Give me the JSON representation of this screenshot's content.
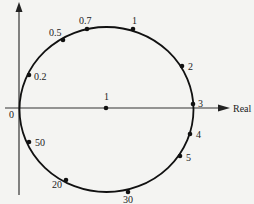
{
  "diagram": {
    "type": "nyquist-plot",
    "axis": {
      "real_label": "Real",
      "origin_label": "0"
    },
    "center_point": {
      "label": "1",
      "x": 106,
      "y": 108,
      "lx": 106,
      "ly": 100
    },
    "points": [
      {
        "label": "0.2",
        "x": 29,
        "y": 75,
        "lx": 34,
        "ly": 80
      },
      {
        "label": "0.5",
        "x": 63,
        "y": 40,
        "lx": 49,
        "ly": 36
      },
      {
        "label": "0.7",
        "x": 87,
        "y": 29,
        "lx": 79,
        "ly": 24
      },
      {
        "label": "1",
        "x": 133,
        "y": 29,
        "lx": 132,
        "ly": 24
      },
      {
        "label": "2",
        "x": 182,
        "y": 66,
        "lx": 188,
        "ly": 70
      },
      {
        "label": "3",
        "x": 193,
        "y": 104,
        "lx": 198,
        "ly": 107
      },
      {
        "label": "4",
        "x": 190,
        "y": 134,
        "lx": 196,
        "ly": 138
      },
      {
        "label": "5",
        "x": 180,
        "y": 156,
        "lx": 186,
        "ly": 161
      },
      {
        "label": "30",
        "x": 128,
        "y": 192,
        "lx": 123,
        "ly": 203
      },
      {
        "label": "20",
        "x": 66,
        "y": 180,
        "lx": 52,
        "ly": 188
      },
      {
        "label": "50",
        "x": 29,
        "y": 142,
        "lx": 35,
        "ly": 146
      }
    ]
  }
}
